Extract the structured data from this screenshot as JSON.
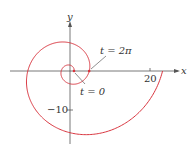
{
  "chart_data": {
    "type": "line",
    "title": "",
    "xlabel": "x",
    "ylabel": "y",
    "curve": "spiral x = e^(t/4) cos t, y = e^(t/4) sin t, 0 <= t <= 4π",
    "param": {
      "t_start": 0,
      "t_end": 12.566,
      "r_formula": "e^(t/4)"
    },
    "x_ticks": [
      {
        "value": 20,
        "label": "20"
      }
    ],
    "y_ticks": [
      {
        "value": -10,
        "label": "−10"
      }
    ],
    "annotations": [
      {
        "text": "t = 2π",
        "point": [
          4.81,
          0
        ]
      },
      {
        "text": "t = 0",
        "point": [
          1,
          0
        ]
      }
    ],
    "xlim": [
      -17,
      30
    ],
    "ylim": [
      -19,
      17
    ],
    "grid": false,
    "line_color": "#d9343e"
  },
  "labels": {
    "x_axis": "x",
    "y_axis": "y",
    "tick_20": "20",
    "tick_neg10": "−10",
    "ann_2pi": "t = 2π",
    "ann_0": "t = 0"
  }
}
